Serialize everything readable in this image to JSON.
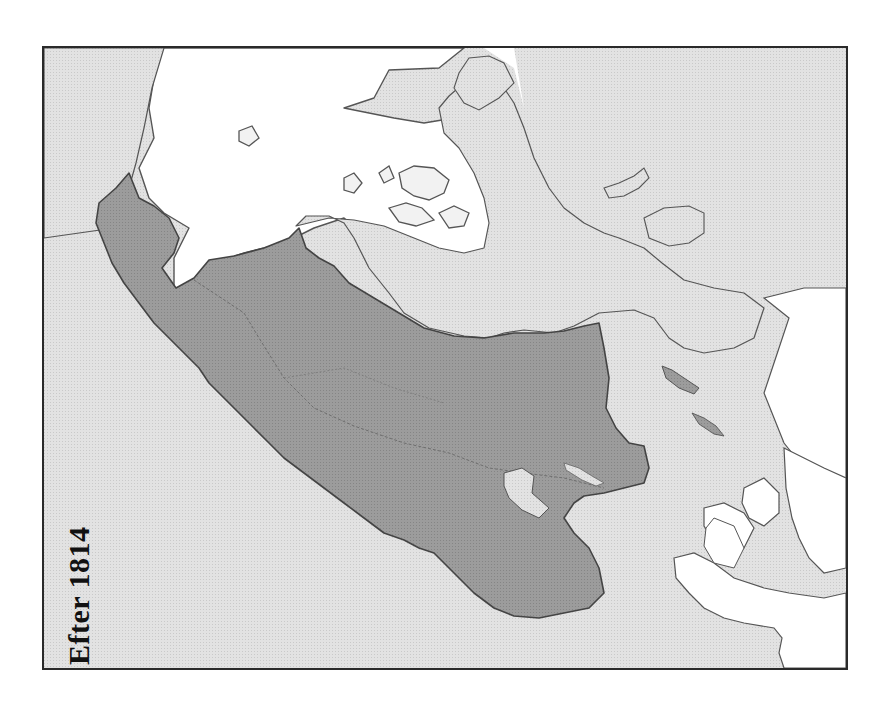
{
  "map": {
    "title": "Efter 1814",
    "colors": {
      "territory": "#9a9a9a",
      "sea": "#e0e0e0",
      "other_land": "#ffffff",
      "coastline": "#555555",
      "frame": "#2a2a2a"
    },
    "legend_regions": [
      {
        "name": "highlighted-territory",
        "fill": "#9a9a9a"
      },
      {
        "name": "sea",
        "fill": "#e0e0e0"
      },
      {
        "name": "other-land",
        "fill": "#ffffff"
      }
    ]
  }
}
